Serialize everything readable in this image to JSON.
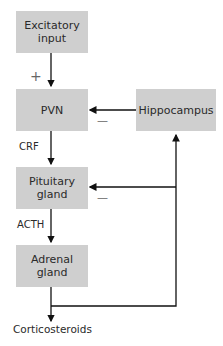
{
  "nodes": {
    "excitatory": "Excitatory\ninput",
    "pvn": "PVN",
    "hippocampus": "Hippocampus",
    "pituitary": "Pituitary\ngland",
    "adrenal": "Adrenal\ngland"
  },
  "labels": {
    "crf": "CRF",
    "acth": "ACTH",
    "output": "Corticosteroids",
    "plus": "+",
    "minus_pvn": "—",
    "minus_pit": "—"
  },
  "colors": {
    "box": "#cfcfcf",
    "line": "#111111"
  }
}
